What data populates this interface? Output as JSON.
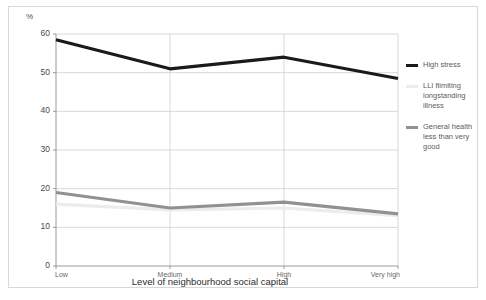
{
  "axis": {
    "unit_label": "%",
    "xaxis_title": "Level of neighbourhood social capital",
    "yticks": [
      "0",
      "10",
      "20",
      "30",
      "40",
      "50",
      "60"
    ],
    "xticks": [
      "Low",
      "Medium",
      "High",
      "Very high"
    ]
  },
  "legend": {
    "items": [
      {
        "label": "High stress",
        "color": "#1a1a1a",
        "swatch_name": "legend-swatch-high-stress"
      },
      {
        "label": "LLI flimiting\nlongstanding\nillness",
        "color": "#ececec",
        "swatch_name": "legend-swatch-lli"
      },
      {
        "label": "General health\nless than very\ngood",
        "color": "#919191",
        "swatch_name": "legend-swatch-general-health"
      }
    ]
  },
  "chart_data": {
    "type": "line",
    "title": "",
    "subtitle": "",
    "xlabel": "Level of neighbourhood social capital",
    "ylabel": "%",
    "categories": [
      "Low",
      "Medium",
      "High",
      "Very high"
    ],
    "ylim": [
      0,
      60
    ],
    "ytick_step": 10,
    "grid": true,
    "legend_position": "right",
    "series": [
      {
        "name": "High stress",
        "color": "#1a1a1a",
        "width": 3.2,
        "values": [
          58.5,
          51.0,
          54.0,
          48.5
        ]
      },
      {
        "name": "LLI flimiting longstanding illness",
        "color": "#ececec",
        "width": 3.2,
        "values": [
          16.0,
          14.5,
          15.0,
          13.0
        ]
      },
      {
        "name": "General health less than very good",
        "color": "#919191",
        "width": 3.2,
        "values": [
          19.0,
          15.0,
          16.5,
          13.5
        ]
      }
    ]
  }
}
